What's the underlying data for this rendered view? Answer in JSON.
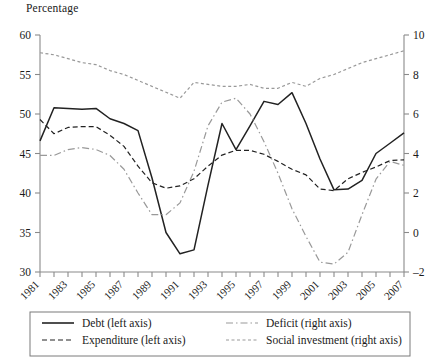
{
  "figure": {
    "axis_title": "Percentage",
    "left_axis": {
      "ticks": [
        30,
        35,
        40,
        45,
        50,
        55,
        60
      ],
      "min": 30,
      "max": 60
    },
    "right_axis": {
      "ticks": [
        -2,
        0,
        2,
        4,
        6,
        8,
        10
      ],
      "min": -2,
      "max": 10
    },
    "x_axis": {
      "labels": [
        "1981",
        "1983",
        "1985",
        "1987",
        "1989",
        "1991",
        "1993",
        "1995",
        "1997",
        "1999",
        "2001",
        "2003",
        "2005",
        "2007"
      ],
      "min": 1981,
      "max": 2007
    }
  },
  "legend": {
    "items": [
      {
        "label": "Debt (left axis)",
        "style": "solid",
        "color": "#222222"
      },
      {
        "label": "Deficit (right axis)",
        "style": "dashdot",
        "color": "#999999"
      },
      {
        "label": "Expenditure (left axis)",
        "style": "dashed",
        "color": "#222222"
      },
      {
        "label": "Social investment (right axis)",
        "style": "dotted",
        "color": "#999999"
      }
    ]
  },
  "chart_data": {
    "type": "line",
    "title": "",
    "ylabel": "Percentage",
    "xlabel": "",
    "ylim": [
      30,
      60
    ],
    "ylim_right": [
      -2,
      10
    ],
    "grid": false,
    "legend_position": "bottom",
    "x": [
      1981,
      1982,
      1983,
      1984,
      1985,
      1986,
      1987,
      1988,
      1989,
      1990,
      1991,
      1992,
      1993,
      1994,
      1995,
      1996,
      1997,
      1998,
      1999,
      2000,
      2001,
      2002,
      2003,
      2004,
      2005,
      2006,
      2007
    ],
    "series": [
      {
        "name": "Debt (left axis)",
        "axis": "left",
        "style": "solid",
        "color": "#222222",
        "values": [
          46.6,
          50.8,
          50.7,
          50.6,
          50.7,
          49.4,
          48.8,
          47.9,
          41.9,
          35.0,
          32.3,
          32.8,
          41.0,
          48.8,
          45.5,
          48.5,
          51.6,
          51.2,
          52.7,
          48.8,
          44.3,
          40.4,
          40.5,
          41.6,
          45.0,
          46.3,
          47.6
        ]
      },
      {
        "name": "Expenditure (left axis)",
        "axis": "left",
        "style": "dashed",
        "color": "#222222",
        "values": [
          49.3,
          47.5,
          48.3,
          48.4,
          48.4,
          47.3,
          45.9,
          43.4,
          41.3,
          40.6,
          40.9,
          41.8,
          43.4,
          44.8,
          45.4,
          45.4,
          44.9,
          44.0,
          43.0,
          42.3,
          40.5,
          40.3,
          41.8,
          42.6,
          43.3,
          44.1,
          44.2
        ]
      },
      {
        "name": "Deficit (right axis)",
        "axis": "right",
        "style": "dashdot",
        "color": "#999999",
        "values": [
          3.9,
          3.9,
          4.2,
          4.3,
          4.2,
          3.9,
          3.2,
          2.0,
          0.9,
          0.9,
          1.5,
          3.1,
          5.4,
          6.6,
          6.8,
          6.0,
          4.6,
          3.0,
          1.2,
          -0.2,
          -1.5,
          -1.6,
          -1.0,
          0.9,
          2.7,
          3.6,
          3.4
        ]
      },
      {
        "name": "Social investment (right axis)",
        "axis": "right",
        "style": "dotted",
        "color": "#999999",
        "values": [
          9.1,
          9.0,
          8.8,
          8.6,
          8.5,
          8.2,
          8.0,
          7.7,
          7.4,
          7.1,
          6.8,
          7.6,
          7.5,
          7.4,
          7.4,
          7.5,
          7.3,
          7.3,
          7.6,
          7.4,
          7.8,
          8.0,
          8.3,
          8.6,
          8.8,
          9.0,
          9.2
        ]
      }
    ]
  }
}
